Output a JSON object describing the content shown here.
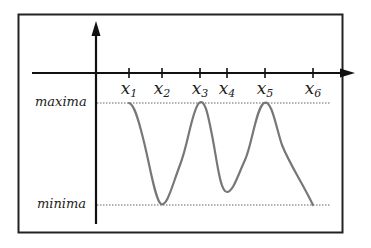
{
  "diagram": {
    "type": "function-extrema-illustration",
    "x_labels": [
      {
        "base": "x",
        "sub": "1",
        "x": 129
      },
      {
        "base": "x",
        "sub": "2",
        "x": 162
      },
      {
        "base": "x",
        "sub": "3",
        "x": 200
      },
      {
        "base": "x",
        "sub": "4",
        "x": 227
      },
      {
        "base": "x",
        "sub": "5",
        "x": 265
      },
      {
        "base": "x",
        "sub": "6",
        "x": 313
      }
    ],
    "maxima_label": "maxima",
    "minima_label": "minima",
    "colors": {
      "frame": "#222222",
      "axis": "#111111",
      "curve": "#777777",
      "guide": "#999999",
      "text": "#222222"
    }
  }
}
